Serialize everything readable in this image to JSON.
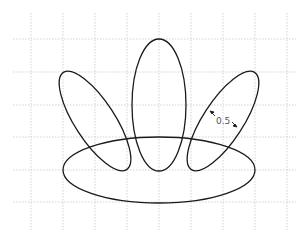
{
  "diagram": {
    "dimension_label": "0.5",
    "colors": {
      "stroke": "#1a1a1a",
      "grid": "#c8c8c8",
      "background": "#ffffff",
      "label": "#555555"
    }
  }
}
